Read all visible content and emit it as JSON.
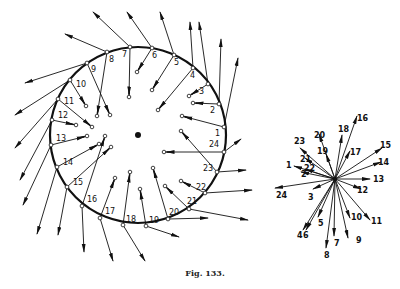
{
  "figure": {
    "caption": "Fig. 133.",
    "ink_color": "#111111"
  },
  "rim_diagram": {
    "center": [
      138,
      135
    ],
    "radius": 88,
    "points": [
      {
        "label": "1",
        "rim": [
          224,
          127
        ],
        "inner": [
          182,
          116
        ],
        "outer": [
          238,
          58
        ],
        "lab": [
          -9,
          9
        ]
      },
      {
        "label": "2",
        "rim": [
          219,
          104
        ],
        "inner": [
          193,
          103
        ],
        "outer": [
          221,
          39
        ],
        "lab": [
          -9,
          9
        ]
      },
      {
        "label": "3",
        "rim": [
          208,
          84
        ],
        "inner": [
          189,
          96
        ],
        "outer": [
          199,
          22
        ],
        "lab": [
          -9,
          10
        ]
      },
      {
        "label": "4",
        "rim": [
          193,
          68
        ],
        "inner": [
          158,
          110
        ],
        "outer": [
          190,
          22
        ],
        "lab": [
          -3,
          10
        ]
      },
      {
        "label": "5",
        "rim": [
          174,
          55
        ],
        "inner": [
          152,
          90
        ],
        "outer": [
          160,
          12
        ],
        "lab": [
          0,
          10
        ]
      },
      {
        "label": "6",
        "rim": [
          152,
          48
        ],
        "inner": [
          137,
          72
        ],
        "outer": [
          127,
          12
        ],
        "lab": [
          0,
          10
        ]
      },
      {
        "label": "7",
        "rim": [
          130,
          47
        ],
        "inner": [
          129,
          97
        ],
        "outer": [
          93,
          12
        ],
        "lab": [
          -8,
          10
        ]
      },
      {
        "label": "8",
        "rim": [
          107,
          52
        ],
        "inner": [
          97,
          116
        ],
        "outer": [
          65,
          34
        ],
        "lab": [
          2,
          10
        ]
      },
      {
        "label": "9",
        "rim": [
          87,
          63
        ],
        "inner": [
          110,
          115
        ],
        "outer": [
          25,
          83
        ],
        "lab": [
          4,
          9
        ]
      },
      {
        "label": "10",
        "rim": [
          70,
          80
        ],
        "inner": [
          86,
          106
        ],
        "outer": [
          15,
          115
        ],
        "lab": [
          6,
          7
        ]
      },
      {
        "label": "11",
        "rim": [
          58,
          99
        ],
        "inner": [
          92,
          127
        ],
        "outer": [
          15,
          148
        ],
        "lab": [
          6,
          5
        ]
      },
      {
        "label": "12",
        "rim": [
          52,
          120
        ],
        "inner": [
          76,
          125
        ],
        "outer": [
          20,
          180
        ],
        "lab": [
          6,
          -2
        ]
      },
      {
        "label": "13",
        "rim": [
          51,
          145
        ],
        "inner": [
          87,
          136
        ],
        "outer": [
          23,
          205
        ],
        "lab": [
          5,
          -4
        ]
      },
      {
        "label": "14",
        "rim": [
          57,
          167
        ],
        "inner": [
          99,
          144
        ],
        "outer": [
          37,
          234
        ],
        "lab": [
          6,
          -2
        ]
      },
      {
        "label": "15",
        "rim": [
          67,
          187
        ],
        "inner": [
          111,
          147
        ],
        "outer": [
          58,
          235
        ],
        "lab": [
          6,
          -2
        ]
      },
      {
        "label": "16",
        "rim": [
          82,
          206
        ],
        "inner": [
          105,
          136
        ],
        "outer": [
          84,
          252
        ],
        "lab": [
          5,
          -4
        ]
      },
      {
        "label": "17",
        "rim": [
          100,
          218
        ],
        "inner": [
          115,
          178
        ],
        "outer": [
          113,
          261
        ],
        "lab": [
          5,
          -4
        ]
      },
      {
        "label": "18",
        "rim": [
          123,
          225
        ],
        "inner": [
          130,
          172
        ],
        "outer": [
          145,
          261
        ],
        "lab": [
          3,
          -3
        ]
      },
      {
        "label": "19",
        "rim": [
          146,
          226
        ],
        "inner": [
          140,
          189
        ],
        "outer": [
          179,
          237
        ],
        "lab": [
          3,
          -3
        ]
      },
      {
        "label": "20",
        "rim": [
          168,
          219
        ],
        "inner": [
          153,
          168
        ],
        "outer": [
          208,
          218
        ],
        "lab": [
          1,
          -4
        ]
      },
      {
        "label": "21",
        "rim": [
          189,
          209
        ],
        "inner": [
          165,
          186
        ],
        "outer": [
          248,
          220
        ],
        "lab": [
          -2,
          -5
        ]
      },
      {
        "label": "22",
        "rim": [
          205,
          193
        ],
        "inner": [
          181,
          181
        ],
        "outer": [
          252,
          190
        ],
        "lab": [
          -9,
          -3
        ]
      },
      {
        "label": "23",
        "rim": [
          217,
          172
        ],
        "inner": [
          181,
          131
        ],
        "outer": [
          246,
          170
        ],
        "lab": [
          -14,
          -1
        ]
      },
      {
        "label": "24",
        "rim": [
          224,
          152
        ],
        "inner": [
          164,
          152
        ],
        "outer": [
          241,
          139
        ],
        "lab": [
          -15,
          -5
        ]
      }
    ]
  },
  "star_diagram": {
    "center": [
      335,
      179
    ],
    "vectors": [
      {
        "label": "1",
        "tip": [
          294,
          166
        ],
        "lab": [
          286,
          168
        ]
      },
      {
        "label": "2",
        "tip": [
          301,
          172
        ],
        "lab": [
          301,
          177
        ]
      },
      {
        "label": "3",
        "tip": [
          313,
          189
        ],
        "lab": [
          308,
          200
        ]
      },
      {
        "label": "4",
        "tip": [
          303,
          230
        ],
        "lab": [
          297,
          238
        ]
      },
      {
        "label": "5",
        "tip": [
          318,
          217
        ],
        "lab": [
          318,
          226
        ]
      },
      {
        "label": "6",
        "tip": [
          306,
          230
        ],
        "lab": [
          303,
          238
        ]
      },
      {
        "label": "7",
        "tip": [
          334,
          236
        ],
        "lab": [
          334,
          246
        ]
      },
      {
        "label": "8",
        "tip": [
          326,
          248
        ],
        "lab": [
          324,
          258
        ]
      },
      {
        "label": "9",
        "tip": [
          348,
          238
        ],
        "lab": [
          356,
          243
        ]
      },
      {
        "label": "10",
        "tip": [
          350,
          218
        ],
        "lab": [
          351,
          220
        ]
      },
      {
        "label": "11",
        "tip": [
          370,
          220
        ],
        "lab": [
          371,
          224
        ]
      },
      {
        "label": "12",
        "tip": [
          361,
          189
        ],
        "lab": [
          357,
          193
        ]
      },
      {
        "label": "13",
        "tip": [
          370,
          179
        ],
        "lab": [
          373,
          182
        ]
      },
      {
        "label": "14",
        "tip": [
          381,
          162
        ],
        "lab": [
          378,
          165
        ]
      },
      {
        "label": "15",
        "tip": [
          382,
          148
        ],
        "lab": [
          380,
          148
        ]
      },
      {
        "label": "16",
        "tip": [
          357,
          116
        ],
        "lab": [
          357,
          121
        ]
      },
      {
        "label": "17",
        "tip": [
          350,
          151
        ],
        "lab": [
          350,
          155
        ]
      },
      {
        "label": "18",
        "tip": [
          342,
          135
        ],
        "lab": [
          338,
          132
        ]
      },
      {
        "label": "19",
        "tip": [
          326,
          154
        ],
        "lab": [
          317,
          154
        ]
      },
      {
        "label": "20",
        "tip": [
          319,
          134
        ],
        "lab": [
          314,
          138
        ]
      },
      {
        "label": "21",
        "tip": [
          305,
          158
        ],
        "lab": [
          300,
          162
        ]
      },
      {
        "label": "22",
        "tip": [
          305,
          169
        ],
        "lab": [
          304,
          171
        ]
      },
      {
        "label": "23",
        "tip": [
          300,
          148
        ],
        "lab": [
          294,
          144
        ]
      },
      {
        "label": "24",
        "tip": [
          275,
          188
        ],
        "lab": [
          276,
          198
        ]
      }
    ]
  }
}
